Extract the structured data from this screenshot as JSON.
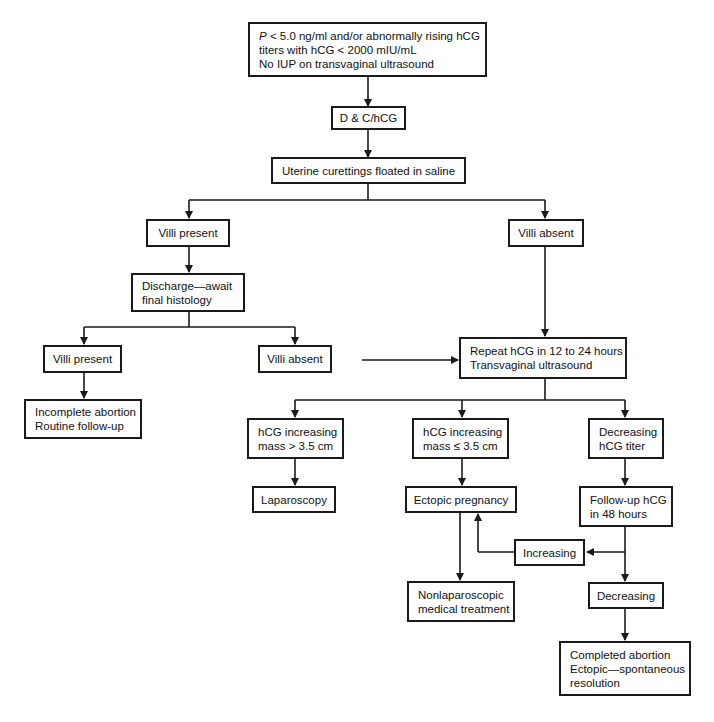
{
  "diagram": {
    "type": "clinical-flowchart",
    "nodes": {
      "start": {
        "lines": [
          "< 5.0 ng/ml and/or abnormally rising hCG",
          "titers with hCG < 2000 mIU/mL",
          "No IUP on transvaginal ultrasound"
        ],
        "italic_prefix": "P"
      },
      "dc": {
        "lines": [
          "D & C/hCG"
        ]
      },
      "curettings": {
        "lines": [
          "Uterine curettings floated in saline"
        ]
      },
      "villi_present_1": {
        "lines": [
          "Villi present"
        ]
      },
      "villi_absent_1": {
        "lines": [
          "Villi absent"
        ]
      },
      "discharge": {
        "lines": [
          "Discharge—await",
          "final histology"
        ]
      },
      "villi_present_2": {
        "lines": [
          "Villi present"
        ]
      },
      "villi_absent_2": {
        "lines": [
          "Villi absent"
        ]
      },
      "incomplete": {
        "lines": [
          "Incomplete abortion",
          "Routine follow-up"
        ]
      },
      "repeat": {
        "lines": [
          "Repeat hCG in 12 to 24 hours",
          "Transvaginal ultrasound"
        ]
      },
      "hcg_gt": {
        "lines": [
          "hCG increasing",
          "mass > 3.5 cm"
        ]
      },
      "hcg_le": {
        "lines": [
          "hCG increasing",
          "mass ≤ 3.5 cm"
        ]
      },
      "decreasing_titer": {
        "lines": [
          "Decreasing",
          "hCG titer"
        ]
      },
      "laparoscopy": {
        "lines": [
          "Laparoscopy"
        ]
      },
      "ectopic": {
        "lines": [
          "Ectopic pregnancy"
        ]
      },
      "followup": {
        "lines": [
          "Follow-up hCG",
          "in 48 hours"
        ]
      },
      "increasing": {
        "lines": [
          "Increasing"
        ]
      },
      "nonlap": {
        "lines": [
          "Nonlaparoscopic",
          "medical treatment"
        ]
      },
      "decreasing": {
        "lines": [
          "Decreasing"
        ]
      },
      "completed": {
        "lines": [
          "Completed abortion",
          "Ectopic—spontaneous",
          "resolution"
        ]
      }
    },
    "edges": [
      [
        "start",
        "dc"
      ],
      [
        "dc",
        "curettings"
      ],
      [
        "curettings",
        "villi_present_1"
      ],
      [
        "curettings",
        "villi_absent_1"
      ],
      [
        "villi_present_1",
        "discharge"
      ],
      [
        "discharge",
        "villi_present_2"
      ],
      [
        "discharge",
        "villi_absent_2"
      ],
      [
        "villi_present_2",
        "incomplete"
      ],
      [
        "villi_absent_2",
        "repeat"
      ],
      [
        "villi_absent_1",
        "repeat"
      ],
      [
        "repeat",
        "hcg_gt"
      ],
      [
        "repeat",
        "hcg_le"
      ],
      [
        "repeat",
        "decreasing_titer"
      ],
      [
        "hcg_gt",
        "laparoscopy"
      ],
      [
        "hcg_le",
        "ectopic"
      ],
      [
        "decreasing_titer",
        "followup"
      ],
      [
        "ectopic",
        "nonlap"
      ],
      [
        "followup",
        "increasing"
      ],
      [
        "increasing",
        "ectopic"
      ],
      [
        "followup",
        "decreasing"
      ],
      [
        "decreasing",
        "completed"
      ]
    ],
    "colors": {
      "line": "#1a1a1a",
      "background": "#ffffff"
    }
  }
}
